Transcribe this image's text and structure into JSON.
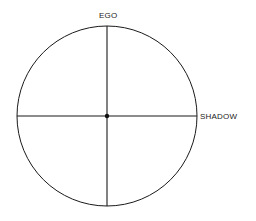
{
  "diagram": {
    "title": "",
    "labels": {
      "top": "EGO",
      "right": "SHADOW"
    },
    "shapes": {
      "circle": {
        "cx": 107,
        "cy": 116,
        "r": 90
      },
      "center_dot": {
        "cx": 107,
        "cy": 116,
        "r": 2.2
      }
    },
    "colors": {
      "stroke": "#1a1a1a",
      "text": "#222222",
      "background": "#ffffff"
    }
  }
}
